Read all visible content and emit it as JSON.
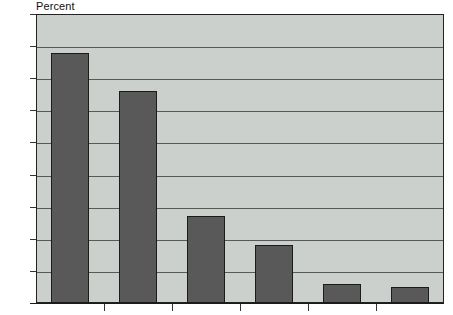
{
  "chart_data": {
    "type": "bar",
    "title": "",
    "subtitle": "",
    "ylabel": "Percent",
    "xlabel": "",
    "ylim": [
      0,
      45
    ],
    "ytick_values": [
      0,
      5,
      10,
      15,
      20,
      25,
      30,
      35,
      40,
      45
    ],
    "ytick_labels": [
      "0",
      "5",
      "10",
      "15",
      "20",
      "25",
      "30",
      "35",
      "40",
      "45"
    ],
    "categories": [
      "",
      "",
      "",
      "",
      "",
      ""
    ],
    "values": [
      39,
      33,
      13.5,
      9,
      3,
      2.5
    ],
    "grid": true,
    "legend": null,
    "legend_position": "none",
    "annotations": [],
    "bar_color": "#595959",
    "bar_edge_color": "#1b1b1b",
    "plot_background": "#ccd0cd",
    "gridline_color": "#555a57",
    "axis_color": "#1b1b1b",
    "page_background": "#ffffff",
    "text_color": "#0d0d0d",
    "xtick_count": 5
  }
}
